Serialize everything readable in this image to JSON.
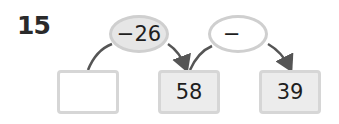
{
  "problem": {
    "number": "15",
    "operations": [
      {
        "label": "−26",
        "style": "filled"
      },
      {
        "label": "−",
        "style": "empty"
      }
    ],
    "boxes": [
      {
        "value": "",
        "style": "white"
      },
      {
        "value": "58",
        "style": "gray"
      },
      {
        "value": "39",
        "style": "gray"
      }
    ]
  },
  "colors": {
    "border": "#cfcfcf",
    "fill_gray": "#e6e6e6",
    "arrow": "#555555",
    "text": "#1e1e1e"
  }
}
